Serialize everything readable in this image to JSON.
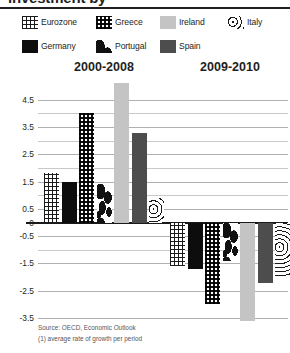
{
  "title_fragment": "investment by",
  "legend": {
    "rows": [
      [
        {
          "label": "Eurozone",
          "pattern": "crosshatch-grid"
        },
        {
          "label": "Greece",
          "pattern": "checker-dots"
        },
        {
          "label": "Ireland",
          "pattern": "solid-light-gray"
        },
        {
          "label": "Italy",
          "pattern": "concentric-waves"
        }
      ],
      [
        {
          "label": "Germany",
          "pattern": "solid-black"
        },
        {
          "label": "Portugal",
          "pattern": "irregular-blotches"
        },
        {
          "label": "Spain",
          "pattern": "solid-dark-gray"
        }
      ]
    ]
  },
  "footnotes": [
    "Source: OECD, Economic Outlook",
    "(1) average rate of growth per period"
  ],
  "chart_data": {
    "type": "bar",
    "title": "",
    "xlabel": "",
    "ylabel": "",
    "ylim": [
      -3.5,
      5.3
    ],
    "yticks": [
      4.5,
      3.5,
      2.5,
      1.5,
      0.5,
      0,
      -0.5,
      -1.5,
      -2.5,
      -3.5
    ],
    "ytick_labels": [
      "4.5",
      "3.5",
      "2.5",
      "1.5",
      "0.5",
      "0",
      "-0.5",
      "-1.5",
      "-2.5",
      "-3.5"
    ],
    "minor_gridlines": [
      4.0,
      3.0,
      2.0,
      1.0,
      -1.0
    ],
    "grid": true,
    "zero_line": 0,
    "legend_position": "top",
    "categories": [
      "2000-2008",
      "2009-2010"
    ],
    "series": [
      {
        "name": "Eurozone",
        "pattern": "crosshatch-grid",
        "values": [
          1.8,
          -1.6
        ]
      },
      {
        "name": "Germany",
        "pattern": "solid-black",
        "values": [
          1.5,
          -1.7
        ]
      },
      {
        "name": "Greece",
        "pattern": "checker-dots",
        "values": [
          4.0,
          -3.0
        ]
      },
      {
        "name": "Portugal",
        "pattern": "irregular-blotches",
        "values": [
          1.4,
          -1.4
        ]
      },
      {
        "name": "Ireland",
        "pattern": "solid-light-gray",
        "values": [
          5.1,
          -3.6
        ]
      },
      {
        "name": "Spain",
        "pattern": "solid-dark-gray",
        "values": [
          3.3,
          -2.2
        ]
      },
      {
        "name": "Italy",
        "pattern": "concentric-waves",
        "values": [
          0.9,
          -2.0
        ]
      }
    ]
  }
}
